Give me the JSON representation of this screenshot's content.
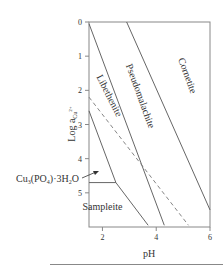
{
  "chart_data": {
    "type": "diagram",
    "title": "",
    "xlabel": "pH",
    "ylabel": "Log a_Cu2+",
    "ylabel_parts": {
      "main": "Log a",
      "sub": "Cu",
      "sup": "2+"
    },
    "xlim": [
      1.5,
      6
    ],
    "ylim": [
      0,
      6
    ],
    "y_inverted": true,
    "x_ticks": [
      {
        "v": 2,
        "label": "2"
      },
      {
        "v": 4,
        "label": "4"
      },
      {
        "v": 6,
        "label": "6"
      }
    ],
    "y_ticks": [
      {
        "v": 0,
        "label": "0"
      },
      {
        "v": 1,
        "label": "1"
      },
      {
        "v": 2,
        "label": "2"
      },
      {
        "v": 3,
        "label": "3"
      },
      {
        "v": 4,
        "label": "4"
      },
      {
        "v": 5,
        "label": "5"
      }
    ],
    "boundaries": [
      {
        "name": "libethenite-pseudomalachite-boundary",
        "style": "solid",
        "points": [
          [
            1.5,
            0.05
          ],
          [
            4.3,
            5.95
          ]
        ]
      },
      {
        "name": "pseudomalachite-cornetite-boundary",
        "style": "solid",
        "points": [
          [
            2.9,
            0
          ],
          [
            6,
            5.5
          ]
        ]
      },
      {
        "name": "libethenite-lower-boundary",
        "style": "solid",
        "points": [
          [
            1.5,
            2.6
          ],
          [
            2.5,
            4.7
          ]
        ]
      },
      {
        "name": "sampleite-top-boundary",
        "style": "solid",
        "points": [
          [
            1.5,
            4.7
          ],
          [
            2.5,
            4.7
          ]
        ]
      },
      {
        "name": "sampleite-right-boundary",
        "style": "solid",
        "points": [
          [
            2.5,
            4.7
          ],
          [
            3.7,
            5.95
          ]
        ]
      },
      {
        "name": "dashed-line",
        "style": "dashed",
        "points": [
          [
            1.5,
            2.2
          ],
          [
            5.2,
            5.95
          ]
        ]
      }
    ],
    "fields": [
      {
        "name": "Cornetite",
        "x": 5.05,
        "y": 1.6,
        "rotate": 70
      },
      {
        "name": "Pseudomalachite",
        "x": 3.3,
        "y": 2.2,
        "rotate": 70
      },
      {
        "name": "Libethenite",
        "x": 2.15,
        "y": 2.2,
        "rotate": 63
      },
      {
        "name": "Sampleite",
        "x": 2.0,
        "y": 5.5,
        "rotate": 0
      }
    ],
    "annotations": [
      {
        "text_main": "Cu",
        "sub1": "3",
        "text_mid": "(PO",
        "sub2": "4",
        "text_mid2": ")·3H",
        "sub3": "2",
        "text_end": "O",
        "full_text": "Cu3(PO4)·3H2O",
        "arrow_to": [
          1.85,
          4.1
        ]
      }
    ]
  }
}
